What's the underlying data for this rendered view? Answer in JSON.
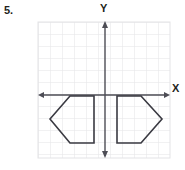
{
  "question": {
    "number": "5."
  },
  "graph": {
    "axis_label_y": "Y",
    "axis_label_x": "X",
    "colors": {
      "grid": "#e3e3e6",
      "axis": "#4d4d55",
      "shape_stroke": "#3a3a42",
      "text": "#231f20",
      "background": "#ffffff"
    },
    "grid": {
      "left": 38,
      "top": 22,
      "right": 170,
      "bottom": 158,
      "cell": 12,
      "columns": 11,
      "rows": 11,
      "visible": true
    },
    "axes": {
      "x_axis_y": 95,
      "y_axis_x": 105,
      "x_axis_start": 38,
      "x_axis_end": 170,
      "y_axis_start": 22,
      "y_axis_end": 158,
      "arrowheads": [
        "left",
        "right",
        "up",
        "down"
      ]
    },
    "shapes": [
      {
        "name": "left-pentagon",
        "points": "70,96 94,96 94,143 70,143 50,119",
        "description": "pentagon pointing left, below x-axis, left of y-axis"
      },
      {
        "name": "right-pentagon",
        "points": "141,96 117,96 117,143 141,143 162,119",
        "description": "pentagon pointing right, below x-axis, right of y-axis, mirror image of left pentagon"
      }
    ]
  }
}
